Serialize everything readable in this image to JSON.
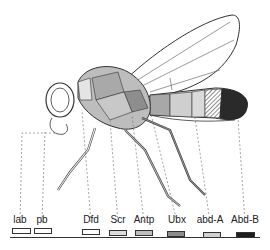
{
  "figure": {
    "type": "hox-gene-body-map",
    "genes": [
      {
        "name": "lab",
        "x": 20,
        "box_left": 12,
        "box_width": 19,
        "color": "#ffffff"
      },
      {
        "name": "pb",
        "x": 42,
        "box_left": 34,
        "box_width": 18,
        "color": "#ffffff"
      },
      {
        "name": "Dfd",
        "x": 91,
        "box_left": 82,
        "box_width": 18,
        "color": "#ffffff"
      },
      {
        "name": "Scr",
        "x": 118,
        "box_left": 109,
        "box_width": 18,
        "color": "#dcdcdc"
      },
      {
        "name": "Antp",
        "x": 144,
        "box_left": 135,
        "box_width": 18,
        "color": "#bdbdbd"
      },
      {
        "name": "Ubx",
        "x": 177,
        "box_left": 167,
        "box_width": 18,
        "color": "#8c8c8c"
      },
      {
        "name": "abd-A",
        "x": 210,
        "box_left": 203,
        "box_width": 18,
        "color": "#d0d0d0"
      },
      {
        "name": "Abd-B",
        "x": 245,
        "box_left": 236,
        "box_width": 19,
        "color": "#1e1e1e"
      }
    ]
  }
}
